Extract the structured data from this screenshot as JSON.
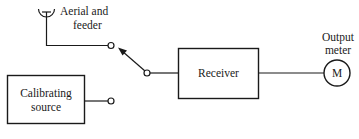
{
  "diagram": {
    "type": "block-diagram",
    "title": "",
    "aerial": {
      "label_line1": "Aerial and",
      "label_line2": "feeder",
      "icon": "antenna-icon"
    },
    "switch": {
      "icon": "switch-arrow-icon",
      "state": "connected to aerial and feeder"
    },
    "receiver": {
      "label": "Receiver"
    },
    "calibrating_source": {
      "label_line1": "Calibrating",
      "label_line2": "source"
    },
    "output_meter": {
      "label_line1": "Output",
      "label_line2": "meter",
      "symbol": "M"
    },
    "connections": [
      {
        "from": "aerial",
        "to": "switch-terminal-top"
      },
      {
        "from": "calibrating_source",
        "to": "switch-terminal-bottom"
      },
      {
        "from": "switch-pivot",
        "to": "receiver"
      },
      {
        "from": "receiver",
        "to": "output_meter"
      }
    ]
  }
}
